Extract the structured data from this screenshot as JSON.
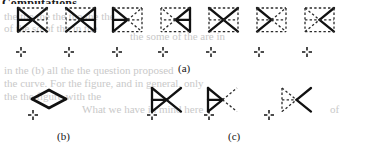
{
  "document": {
    "header_text": "Computations.",
    "page_background": "#ffffff",
    "ink_color": "#101010",
    "ghost_color": "#c9c9c9"
  },
  "figure": {
    "caption_labels": [
      {
        "name": "label-a",
        "text": "(a)",
        "x": 178,
        "y": 62
      },
      {
        "name": "label-b",
        "text": "(b)",
        "x": 57,
        "y": 130
      },
      {
        "name": "label-c",
        "text": "(c)",
        "x": 228,
        "y": 130
      }
    ],
    "rows": [
      {
        "name": "row-a",
        "description": "Seven triangle-pair tilings showing progressive conversion of solid edges to dashed edges",
        "panels": [
          {
            "name": "panel-a1",
            "x": 18,
            "y": 6,
            "solid_parts": [
              "upper-left-triangle",
              "lower-left-triangle",
              "center-rhombus"
            ],
            "dashed_parts": [
              "upper-right-triangle",
              "lower-right-triangle"
            ]
          },
          {
            "name": "panel-a2",
            "x": 66,
            "y": 6,
            "mirrored": true,
            "solid_parts": [
              "upper-right-triangle",
              "lower-right-triangle",
              "center-rhombus"
            ],
            "dashed_parts": [
              "upper-left-triangle",
              "lower-left-triangle"
            ]
          },
          {
            "name": "panel-a3",
            "x": 113,
            "y": 6,
            "solid_parts": [
              "upper-left-triangle",
              "lower-left-triangle"
            ],
            "dashed_parts": [
              "upper-right-triangle",
              "lower-right-triangle",
              "center-rhombus"
            ]
          },
          {
            "name": "panel-a4",
            "x": 161,
            "y": 6,
            "mirrored": true,
            "solid_parts": [
              "upper-right-triangle",
              "lower-right-triangle"
            ],
            "dashed_parts": [
              "upper-left-triangle",
              "lower-left-triangle",
              "center-rhombus"
            ]
          },
          {
            "name": "panel-a5",
            "x": 209,
            "y": 6,
            "solid_parts": [
              "center-rhombus"
            ],
            "dashed_parts": [
              "upper-left-triangle",
              "lower-left-triangle",
              "upper-right-triangle",
              "lower-right-triangle"
            ]
          },
          {
            "name": "panel-a6",
            "x": 257,
            "y": 6,
            "solid_parts": [
              "left-chevron"
            ],
            "dashed_parts": [
              "all-other-edges"
            ]
          },
          {
            "name": "panel-a7",
            "x": 305,
            "y": 6,
            "solid_parts": [
              "right-chevron"
            ],
            "dashed_parts": [
              "all-other-edges"
            ]
          }
        ]
      },
      {
        "name": "row-b",
        "description": "Single solid rhombus",
        "panels": [
          {
            "name": "panel-b1",
            "x": 32,
            "y": 88,
            "solid_parts": [
              "rhombus"
            ],
            "dashed_parts": []
          }
        ]
      },
      {
        "name": "row-c",
        "description": "Three stages of a right-pointing triangle group losing solid edges",
        "panels": [
          {
            "name": "panel-c1",
            "x": 152,
            "y": 86,
            "solid_parts": [
              "upper-left-triangle",
              "lower-left-triangle",
              "center-rhombus"
            ],
            "dashed_parts": []
          },
          {
            "name": "panel-c2",
            "x": 208,
            "y": 86,
            "solid_parts": [
              "upper-left-triangle",
              "lower-left-triangle"
            ],
            "dashed_parts": [
              "center-rhombus-right"
            ]
          },
          {
            "name": "panel-c3",
            "x": 282,
            "y": 86,
            "solid_parts": [
              "right-chevron"
            ],
            "dashed_parts": [
              "upper-left-triangle",
              "lower-left-triangle"
            ]
          }
        ]
      }
    ],
    "origin_markers": [
      {
        "name": "crosshair-a1",
        "x": 21,
        "y": 52
      },
      {
        "name": "crosshair-a2",
        "x": 69,
        "y": 52
      },
      {
        "name": "crosshair-a3",
        "x": 117,
        "y": 52
      },
      {
        "name": "crosshair-a4",
        "x": 163,
        "y": 52
      },
      {
        "name": "crosshair-a5",
        "x": 211,
        "y": 52
      },
      {
        "name": "crosshair-a6",
        "x": 259,
        "y": 52
      },
      {
        "name": "crosshair-a7",
        "x": 307,
        "y": 52
      },
      {
        "name": "crosshair-b1",
        "x": 33,
        "y": 115
      },
      {
        "name": "crosshair-c1",
        "x": 152,
        "y": 115
      },
      {
        "name": "crosshair-c2",
        "x": 209,
        "y": 115
      },
      {
        "name": "crosshair-c3",
        "x": 269,
        "y": 115
      }
    ],
    "style": {
      "solid_stroke_color": "#111111",
      "dashed_stroke_color": "#2a2a2a",
      "solid_stroke_width": 2.3,
      "dashed_stroke_width": 1.3,
      "dash_pattern": "2.4 2.2"
    }
  },
  "ghost_text": [
    {
      "name": "ghost-line-1",
      "text": "the the the the the the the",
      "x": 4,
      "y": 10,
      "size": 11
    },
    {
      "name": "ghost-line-2",
      "text": "of the so of the in the",
      "x": 4,
      "y": 22,
      "size": 11
    },
    {
      "name": "ghost-line-3",
      "text": "the some of the are in",
      "x": 130,
      "y": 30,
      "size": 11
    },
    {
      "name": "ghost-line-4",
      "text": "in the (b)   all the    the question proposed",
      "x": 4,
      "y": 64,
      "size": 11
    },
    {
      "name": "ghost-line-5",
      "text": "the curve. For the figure, and in general, only",
      "x": 4,
      "y": 77,
      "size": 11
    },
    {
      "name": "ghost-line-6",
      "text": "the     the figure with the",
      "x": 4,
      "y": 90,
      "size": 11
    },
    {
      "name": "ghost-line-7",
      "text": "What we have in mind here",
      "x": 82,
      "y": 103,
      "size": 11
    },
    {
      "name": "ghost-line-8",
      "text": "of",
      "x": 330,
      "y": 103,
      "size": 11
    }
  ]
}
